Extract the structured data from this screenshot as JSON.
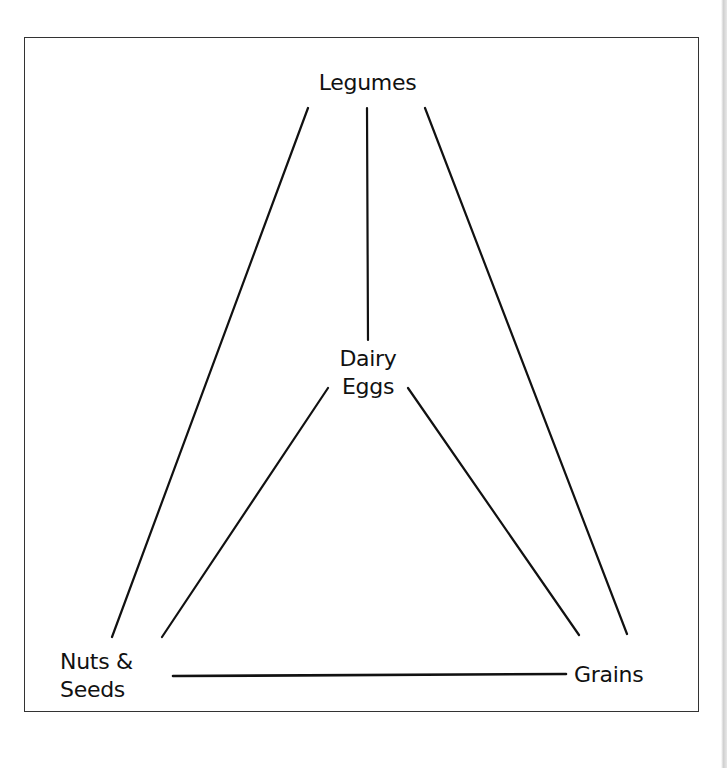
{
  "diagram": {
    "nodes": [
      {
        "id": "legumes",
        "lines": [
          "Legumes"
        ]
      },
      {
        "id": "dairy-eggs",
        "lines": [
          "Dairy",
          "Eggs"
        ]
      },
      {
        "id": "nuts-seeds",
        "lines": [
          "Nuts &",
          "Seeds"
        ]
      },
      {
        "id": "grains",
        "lines": [
          "Grains"
        ]
      }
    ],
    "edges": [
      {
        "from": "legumes",
        "to": "nuts-seeds"
      },
      {
        "from": "legumes",
        "to": "dairy-eggs"
      },
      {
        "from": "legumes",
        "to": "grains"
      },
      {
        "from": "dairy-eggs",
        "to": "nuts-seeds"
      },
      {
        "from": "dairy-eggs",
        "to": "grains"
      },
      {
        "from": "nuts-seeds",
        "to": "grains"
      }
    ],
    "colors": {
      "line": "#111111",
      "border": "#333333",
      "background": "#ffffff"
    }
  }
}
